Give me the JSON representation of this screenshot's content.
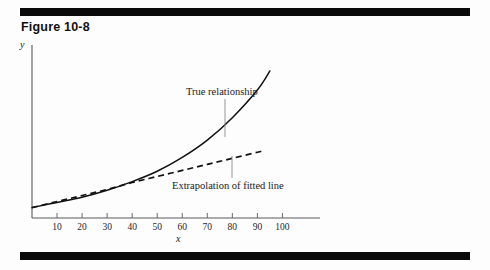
{
  "figure": {
    "title": "Figure 10-8",
    "rules": {
      "color": "#0a0a0a",
      "count": 2
    }
  },
  "chart_data": {
    "type": "line",
    "title": "Figure 10-8",
    "xlabel": "x",
    "ylabel": "y",
    "xlim": [
      0,
      115
    ],
    "ylim": [
      0,
      100
    ],
    "grid": false,
    "legend": "none",
    "xticks": [
      10,
      20,
      30,
      40,
      50,
      60,
      70,
      80,
      90,
      100
    ],
    "xtick_labels": [
      "10",
      "20",
      "30",
      "40",
      "50",
      "60",
      "70",
      "80",
      "90",
      "100"
    ],
    "yticks": [],
    "ytick_labels": [],
    "series": [
      {
        "name": "True relationship",
        "style": "solid",
        "color": "#111111",
        "x": [
          0,
          10,
          20,
          30,
          40,
          50,
          60,
          70,
          80,
          90,
          95
        ],
        "y": [
          6,
          9,
          12,
          16,
          21,
          27,
          35,
          45,
          58,
          74,
          85
        ]
      },
      {
        "name": "Extrapolation of fitted line",
        "style": "dashed",
        "color": "#111111",
        "x": [
          0,
          10,
          20,
          30,
          40,
          50,
          60,
          70,
          80,
          90,
          92
        ],
        "y": [
          6,
          9.5,
          13,
          16.5,
          20.5,
          24,
          27.5,
          31,
          34.5,
          38,
          38.8
        ]
      }
    ],
    "annotations": [
      {
        "text": "True relationship",
        "name": "true-relationship-label",
        "leader": {
          "from": [
            225,
            99
          ],
          "to": [
            225,
            137
          ]
        }
      },
      {
        "text": "Extrapolation of fitted line",
        "name": "extrapolation-label",
        "leader": {
          "from": [
            232,
            178
          ],
          "to": [
            232,
            156
          ]
        }
      }
    ]
  }
}
